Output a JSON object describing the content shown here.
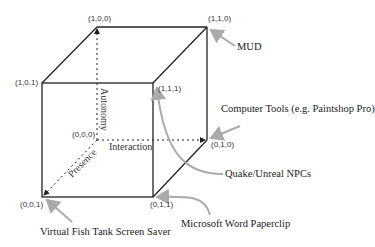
{
  "diagram": {
    "vertices": {
      "v100": "(1,0,0)",
      "v110": "(1,1,0)",
      "v101": "(1,0,1)",
      "v111": "(1,1,1)",
      "v000": "(0,0,0)",
      "v010": "(0,1,0)",
      "v001": "(0,0,1)",
      "v011": "(0,1,1)"
    },
    "axes": {
      "autonomy": "Autonomy",
      "interaction": "Interaction",
      "presence": "Presence"
    },
    "annotations": {
      "mud": "MUD",
      "computer_tools": "Computer Tools (e.g. Paintshop Pro)",
      "quake": "Quake/Unreal NPCs",
      "paperclip": "Microsoft Word Paperclip",
      "fish_tank": "Virtual Fish Tank Screen Saver"
    },
    "colors": {
      "edge": "#222222",
      "arrow": "#aaaaaa"
    }
  }
}
